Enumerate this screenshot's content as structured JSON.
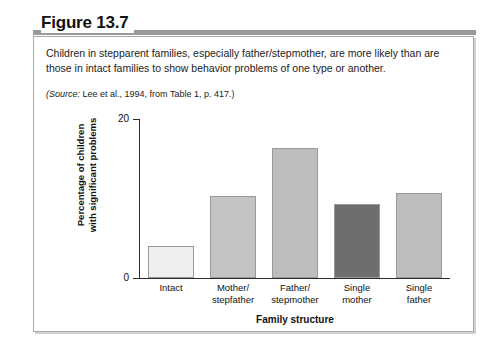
{
  "figure": {
    "label": "Figure 13.7",
    "caption": "Children in stepparent families, especially father/stepmother, are more likely than are those in intact families to show behavior problems of one type or another.",
    "source_prefix": "(Source:",
    "source_text": " Lee et al., 1994, from Table 1, p. 417.)"
  },
  "chart_data": {
    "type": "bar",
    "title": "",
    "categories": [
      "Intact",
      "Mother/\nstepfather",
      "Father/\nstepmother",
      "Single\nmother",
      "Single\nfather"
    ],
    "category_lines": [
      [
        "Intact",
        ""
      ],
      [
        "Mother/",
        "stepfather"
      ],
      [
        "Father/",
        "stepmother"
      ],
      [
        "Single",
        "mother"
      ],
      [
        "Single",
        "father"
      ]
    ],
    "values": [
      4.0,
      10.3,
      16.4,
      9.3,
      10.7
    ],
    "bar_colors": [
      "#eeeeee",
      "#c4c4c4",
      "#bdbdbd",
      "#6e6e6e",
      "#bdbdbd"
    ],
    "bar_border_color": "#9a9a9a",
    "xlabel": "Family structure",
    "ylabel_line1": "Percentage of children",
    "ylabel_line2": "with significant problems",
    "ylim": [
      0,
      20
    ],
    "yticks": [
      0,
      20
    ],
    "ytick_labels": [
      "0",
      "20"
    ],
    "grid": false,
    "legend": false
  },
  "colors": {
    "heading_rule": "#9a9a9a",
    "box_border": "#a8a8a8",
    "axis": "#2b2b2b",
    "text": "#111111"
  }
}
